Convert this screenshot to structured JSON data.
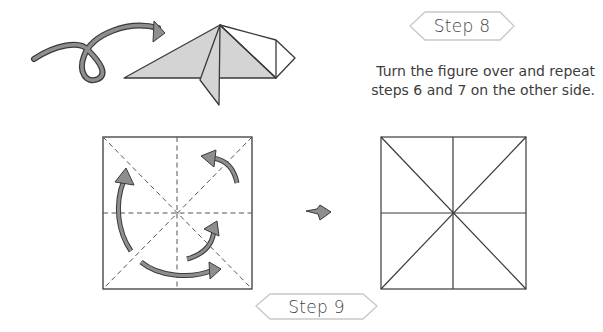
{
  "steps": [
    {
      "label": "Step 8",
      "instruction_lines": [
        "Turn the figure over and repeat",
        "steps 6 and 7 on the other side."
      ],
      "figures": [
        "turn-over-arrow",
        "folded-figure"
      ]
    },
    {
      "label": "Step 9",
      "figures": [
        "square-with-dashed-creases-and-unfold-arrows",
        "result-arrow",
        "square-with-solid-creases"
      ]
    }
  ],
  "colors": {
    "outline": "#3a3a3a",
    "fill_gray": "#d4d4d4",
    "arrow_gray": "#8e8e8e",
    "badge_border": "#c8c8c8"
  }
}
